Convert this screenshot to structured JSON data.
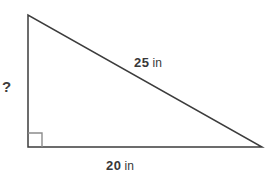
{
  "figure": {
    "type": "right-triangle",
    "sides": {
      "hypotenuse": {
        "value": "25",
        "unit": "in"
      },
      "base": {
        "value": "20",
        "unit": "in"
      },
      "height": {
        "value": "?"
      }
    },
    "right_angle_marker": "bottom-left"
  },
  "colors": {
    "triangle_line": "#3c3c3c",
    "right_angle_marker": "#8c8c8c",
    "text": "#383838",
    "background": "#ffffff"
  }
}
